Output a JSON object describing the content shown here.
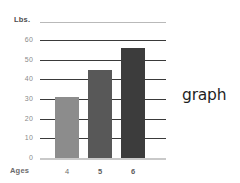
{
  "chart_data": {
    "type": "bar",
    "title": "",
    "subtitle": "",
    "xlabel": "Ages",
    "ylabel": "Lbs.",
    "categories": [
      "4",
      "5",
      "6"
    ],
    "values": [
      31,
      45,
      56
    ],
    "series": [
      {
        "name": "Weight",
        "values": [
          31,
          45,
          56
        ]
      }
    ],
    "ylim": [
      0,
      60
    ],
    "ytick_labels": [
      "60",
      "50",
      "40",
      "30",
      "20",
      "10",
      "0"
    ],
    "ytick_values": [
      60,
      50,
      40,
      30,
      20,
      10,
      0
    ],
    "xtick_labels": [
      "4",
      "5",
      "6"
    ],
    "grid": true,
    "legend": "none",
    "bar_colors": [
      "#8c8c8c",
      "#585858",
      "#3c3c3c"
    ],
    "annotations": [
      "graph"
    ]
  },
  "labels": {
    "y_unit": "Lbs.",
    "x_axis": "Ages",
    "annotation": "graph"
  }
}
